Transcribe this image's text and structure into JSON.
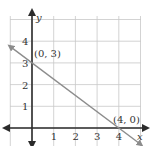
{
  "chart_data": {
    "type": "line",
    "title": "",
    "xlabel": "x",
    "ylabel": "y",
    "xlim": [
      -1,
      5
    ],
    "ylim": [
      -0.8,
      5.1
    ],
    "grid": true,
    "x_ticks": [
      "1",
      "2",
      "3",
      "4"
    ],
    "y_ticks": [
      "1",
      "2",
      "3",
      "4"
    ],
    "series": [
      {
        "name": "line",
        "equation": "y = -3/4 x + 3",
        "x": [
          -1,
          0,
          4,
          5
        ],
        "y": [
          3.75,
          3,
          0,
          -0.75
        ],
        "color": "#8c8c8c"
      }
    ],
    "annotations": [
      {
        "text": "(0, 3)",
        "x": 0,
        "y": 3
      },
      {
        "text": "(4, 0)",
        "x": 4,
        "y": 0
      }
    ]
  },
  "colors": {
    "grid": "#c8c8c8",
    "axis": "#2b2b2b",
    "line": "#8c8c8c",
    "text": "#333333"
  }
}
